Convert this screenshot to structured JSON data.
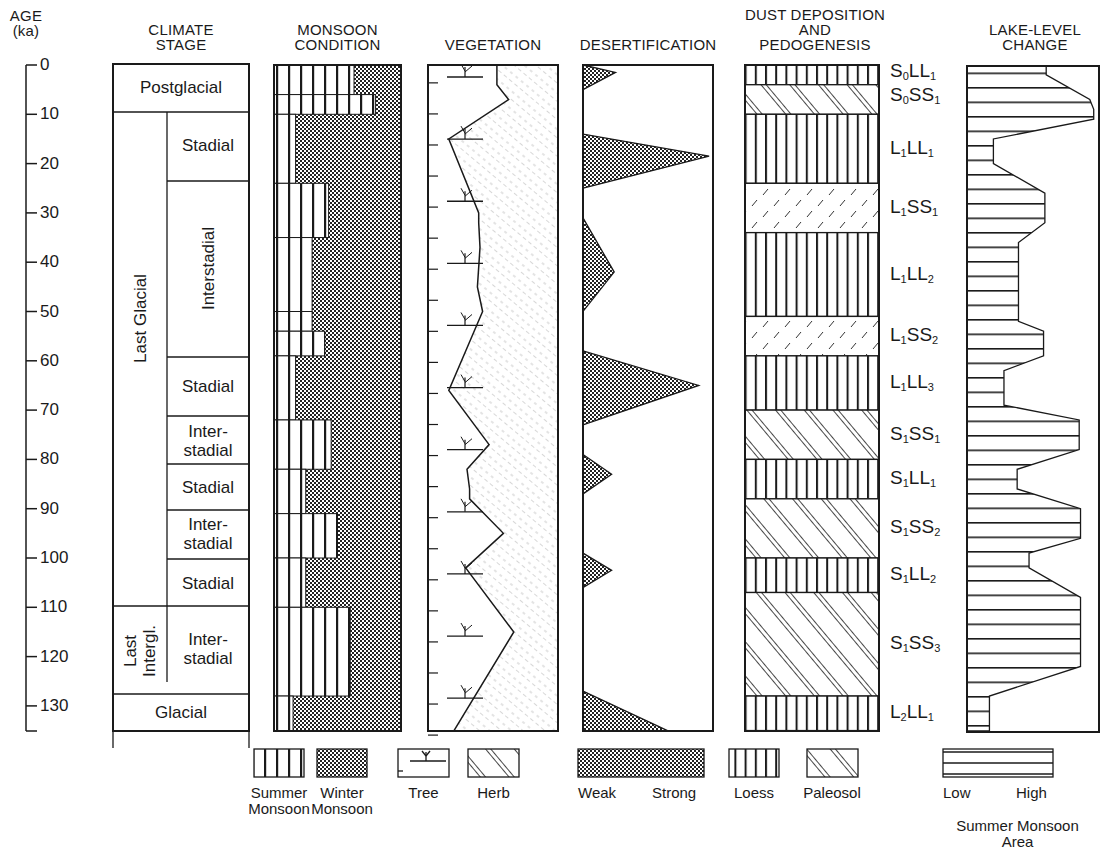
{
  "chart_data": {
    "type": "stratigraphic-column",
    "title": "",
    "y_axis": {
      "label": "AGE",
      "unit": "(ka)",
      "ticks": [
        0,
        10,
        20,
        30,
        40,
        50,
        60,
        70,
        80,
        90,
        100,
        110,
        120,
        130
      ],
      "range": [
        0,
        135
      ],
      "direction": "downward"
    },
    "columns": [
      {
        "key": "climate_stage",
        "header": [
          "CLIMATE",
          "STAGE"
        ],
        "major_units": [
          {
            "label": "Postglacial",
            "from": 0,
            "to": 10
          },
          {
            "label": "Last Glacial",
            "from": 10,
            "to": 110,
            "orientation": "vertical"
          },
          {
            "label": "Last Intergl.",
            "from": 110,
            "to": 128,
            "orientation": "vertical"
          },
          {
            "label": "Glacial",
            "from": 128,
            "to": 135
          }
        ],
        "sub_units": [
          {
            "label": "Stadial",
            "from": 10,
            "to": 24
          },
          {
            "label": "Interstadial",
            "from": 24,
            "to": 60,
            "orientation": "vertical"
          },
          {
            "label": "Stadial",
            "from": 60,
            "to": 72
          },
          {
            "label": "Inter-\nstadial",
            "from": 72,
            "to": 82
          },
          {
            "label": "Stadial",
            "from": 82,
            "to": 91
          },
          {
            "label": "Inter-\nstadial",
            "from": 91,
            "to": 101
          },
          {
            "label": "Stadial",
            "from": 101,
            "to": 110
          },
          {
            "label": "Inter-\nstadial",
            "from": 110,
            "to": 128
          }
        ]
      },
      {
        "key": "monsoon_condition",
        "header": [
          "MONSOON",
          "CONDITION"
        ],
        "note": "fraction = share of width occupied by summer monsoon (vertical stripes); remainder is winter monsoon (stipple)",
        "summer_fraction": [
          {
            "from": 0,
            "to": 6,
            "value": 0.63
          },
          {
            "from": 6,
            "to": 10,
            "value": 0.8
          },
          {
            "from": 10,
            "to": 24,
            "value": 0.17
          },
          {
            "from": 24,
            "to": 35,
            "value": 0.43
          },
          {
            "from": 35,
            "to": 50,
            "value": 0.3
          },
          {
            "from": 50,
            "to": 54,
            "value": 0.3
          },
          {
            "from": 54,
            "to": 59,
            "value": 0.4
          },
          {
            "from": 59,
            "to": 72,
            "value": 0.17
          },
          {
            "from": 72,
            "to": 82,
            "value": 0.45
          },
          {
            "from": 82,
            "to": 91,
            "value": 0.25
          },
          {
            "from": 91,
            "to": 100,
            "value": 0.5
          },
          {
            "from": 100,
            "to": 110,
            "value": 0.25
          },
          {
            "from": 110,
            "to": 128,
            "value": 0.6
          },
          {
            "from": 128,
            "to": 135,
            "value": 0.15
          }
        ]
      },
      {
        "key": "vegetation",
        "header": [
          "VEGETATION"
        ],
        "note": "tree/herb boundary as fraction of column width from left",
        "boundary": [
          [
            0,
            0.53
          ],
          [
            4,
            0.53
          ],
          [
            7,
            0.62
          ],
          [
            15,
            0.16
          ],
          [
            30,
            0.39
          ],
          [
            32,
            0.39
          ],
          [
            37,
            0.4
          ],
          [
            45,
            0.38
          ],
          [
            50,
            0.42
          ],
          [
            58,
            0.29
          ],
          [
            66,
            0.16
          ],
          [
            77,
            0.47
          ],
          [
            82,
            0.3
          ],
          [
            86,
            0.32
          ],
          [
            88,
            0.32
          ],
          [
            95,
            0.58
          ],
          [
            102,
            0.29
          ],
          [
            115,
            0.66
          ],
          [
            135,
            0.2
          ]
        ]
      },
      {
        "key": "desertification",
        "header": [
          "DESERTIFICATION"
        ],
        "note": "peak strength as fraction of width (0=weak,1=strong)",
        "peaks": [
          {
            "from": 0,
            "to": 5,
            "peak_at": 1.5,
            "value": 0.25
          },
          {
            "from": 14,
            "to": 25,
            "peak_at": 18.5,
            "value": 0.97
          },
          {
            "from": 31,
            "to": 50,
            "peak_at": 42,
            "value": 0.24
          },
          {
            "from": 58,
            "to": 73,
            "peak_at": 65,
            "value": 0.89
          },
          {
            "from": 79,
            "to": 87,
            "peak_at": 83,
            "value": 0.22
          },
          {
            "from": 99,
            "to": 106,
            "peak_at": 102.5,
            "value": 0.22
          },
          {
            "from": 127,
            "to": 135,
            "peak_at": 135,
            "value": 0.65
          }
        ]
      },
      {
        "key": "dust_deposition_pedogenesis",
        "header": [
          "DUST DEPOSITION",
          "AND",
          "PEDOGENESIS"
        ],
        "layers": [
          {
            "code": "S0LL1",
            "type": "loess",
            "from": 0,
            "to": 4
          },
          {
            "code": "S0SS1",
            "type": "paleosol",
            "from": 4,
            "to": 10
          },
          {
            "code": "L1LL1",
            "type": "loess",
            "from": 10,
            "to": 24
          },
          {
            "code": "L1SS1",
            "type": "paleosol-weak",
            "from": 24,
            "to": 34
          },
          {
            "code": "L1LL2",
            "type": "loess",
            "from": 34,
            "to": 51
          },
          {
            "code": "L1SS2",
            "type": "paleosol-weak",
            "from": 51,
            "to": 59
          },
          {
            "code": "L1LL3",
            "type": "loess",
            "from": 59,
            "to": 70
          },
          {
            "code": "S1SS1",
            "type": "paleosol",
            "from": 70,
            "to": 80
          },
          {
            "code": "S1LL1",
            "type": "loess",
            "from": 80,
            "to": 88
          },
          {
            "code": "S1SS2",
            "type": "paleosol",
            "from": 88,
            "to": 100
          },
          {
            "code": "S1LL2",
            "type": "loess",
            "from": 100,
            "to": 107
          },
          {
            "code": "S1SS3",
            "type": "paleosol",
            "from": 107,
            "to": 128
          },
          {
            "code": "L2LL1",
            "type": "loess",
            "from": 128,
            "to": 135
          }
        ]
      },
      {
        "key": "lake_level_change",
        "header": [
          "LAKE-LEVEL",
          "CHANGE"
        ],
        "note": "lake level as fraction of column width (low to high)",
        "profile": [
          [
            0,
            0.6
          ],
          [
            2,
            0.6
          ],
          [
            7,
            0.93
          ],
          [
            9,
            0.96
          ],
          [
            11,
            0.96
          ],
          [
            15,
            0.2
          ],
          [
            20,
            0.2
          ],
          [
            26,
            0.59
          ],
          [
            32,
            0.59
          ],
          [
            36,
            0.39
          ],
          [
            42,
            0.39
          ],
          [
            52,
            0.39
          ],
          [
            54,
            0.58
          ],
          [
            59,
            0.58
          ],
          [
            62,
            0.28
          ],
          [
            69,
            0.28
          ],
          [
            72,
            0.85
          ],
          [
            78,
            0.85
          ],
          [
            82,
            0.38
          ],
          [
            86,
            0.38
          ],
          [
            90,
            0.86
          ],
          [
            96,
            0.86
          ],
          [
            99,
            0.47
          ],
          [
            102,
            0.47
          ],
          [
            108,
            0.86
          ],
          [
            122,
            0.86
          ],
          [
            128,
            0.17
          ],
          [
            135,
            0.17
          ]
        ]
      }
    ],
    "legend": [
      {
        "group": "monsoon",
        "items": [
          "Summer\nMonsoon",
          "Winter\nMonsoon"
        ]
      },
      {
        "group": "vegetation",
        "items": [
          "Tree",
          "Herb"
        ]
      },
      {
        "group": "desertification",
        "items": [
          "Weak",
          "Strong"
        ]
      },
      {
        "group": "dust",
        "items": [
          "Loess",
          "Paleosol"
        ]
      },
      {
        "group": "lake",
        "items": [
          "Low",
          "High"
        ],
        "caption": "Summer Monsoon\nArea"
      }
    ]
  },
  "axis": {
    "title_line1": "AGE",
    "title_line2": "(ka)",
    "ticks": [
      "0",
      "10",
      "20",
      "30",
      "40",
      "50",
      "60",
      "70",
      "80",
      "90",
      "100",
      "110",
      "120",
      "130"
    ]
  },
  "headers": {
    "climate_1": "CLIMATE",
    "climate_2": "STAGE",
    "monsoon_1": "MONSOON",
    "monsoon_2": "CONDITION",
    "vegetation": "VEGETATION",
    "desert": "DESERTIFICATION",
    "dust_1": "DUST DEPOSITION",
    "dust_2": "AND",
    "dust_3": "PEDOGENESIS",
    "lake_1": "LAKE-LEVEL",
    "lake_2": "CHANGE"
  },
  "climate": {
    "postglacial": "Postglacial",
    "last_glacial": "Last Glacial",
    "last_intergl_1": "Last",
    "last_intergl_2": "Intergl.",
    "glacial": "Glacial",
    "stadial": "Stadial",
    "interstadial": "Interstadial",
    "inter": "Inter-",
    "stadial_lc": "stadial"
  },
  "layers": [
    {
      "a": "S",
      "s1": "0",
      "b": "LL",
      "s2": "1"
    },
    {
      "a": "S",
      "s1": "0",
      "b": "SS",
      "s2": "1"
    },
    {
      "a": "L",
      "s1": "1",
      "b": "LL",
      "s2": "1"
    },
    {
      "a": "L",
      "s1": "1",
      "b": "SS",
      "s2": "1"
    },
    {
      "a": "L",
      "s1": "1",
      "b": "LL",
      "s2": "2"
    },
    {
      "a": "L",
      "s1": "1",
      "b": "SS",
      "s2": "2"
    },
    {
      "a": "L",
      "s1": "1",
      "b": "LL",
      "s2": "3"
    },
    {
      "a": "S",
      "s1": "1",
      "b": "SS",
      "s2": "1"
    },
    {
      "a": "S",
      "s1": "1",
      "b": "LL",
      "s2": "1"
    },
    {
      "a": "S",
      "s1": "1",
      "b": "SS",
      "s2": "2"
    },
    {
      "a": "S",
      "s1": "1",
      "b": "LL",
      "s2": "2"
    },
    {
      "a": "S",
      "s1": "1",
      "b": "SS",
      "s2": "3"
    },
    {
      "a": "L",
      "s1": "2",
      "b": "LL",
      "s2": "1"
    }
  ],
  "legend": {
    "summer_1": "Summer",
    "summer_2": "Monsoon",
    "winter_1": "Winter",
    "winter_2": "Monsoon",
    "tree": "Tree",
    "herb": "Herb",
    "weak": "Weak",
    "strong": "Strong",
    "loess": "Loess",
    "paleosol": "Paleosol",
    "low": "Low",
    "high": "High",
    "area_1": "Summer Monsoon",
    "area_2": "Area"
  },
  "colors": {
    "ink": "#1a1a1a",
    "paper": "#ffffff",
    "stipple": "#6a6a6a"
  }
}
